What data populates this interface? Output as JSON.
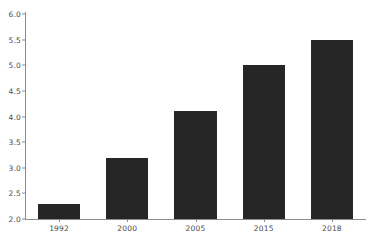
{
  "chart_data": {
    "type": "bar",
    "title": "",
    "subtitle": "",
    "xlabel": "",
    "ylabel": "",
    "categories": [
      "1992",
      "2000",
      "2005",
      "2015",
      "2018"
    ],
    "values": [
      2.3,
      3.2,
      4.1,
      5.0,
      5.5
    ],
    "series": [
      {
        "name": "",
        "values": [
          2.3,
          3.2,
          4.1,
          5.0,
          5.5
        ]
      }
    ],
    "ylim": [
      2.0,
      6.0
    ],
    "ytick_labels": [
      "2.0",
      "2.5",
      "3.0",
      "3.5",
      "4.0",
      "4.5",
      "5.0",
      "5.5",
      "6.0"
    ],
    "ytick_values": [
      2.0,
      2.5,
      3.0,
      3.5,
      4.0,
      4.5,
      5.0,
      5.5,
      6.0
    ],
    "xtick_labels": [
      "1992",
      "2000",
      "2005",
      "2015",
      "2018"
    ],
    "grid": false,
    "legend": false,
    "legend_position": "none",
    "bar_color": "#262626",
    "axis_color": "#8c8c8c",
    "tick_label_color": "#4a4a4a",
    "background_color": "#ffffff",
    "annotations": []
  }
}
